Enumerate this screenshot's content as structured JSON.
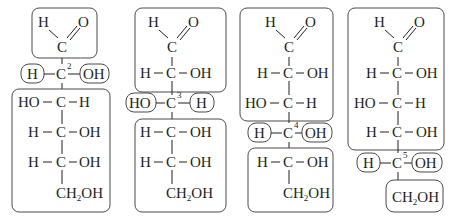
{
  "figure": {
    "panels": [
      {
        "highlighted_carbon": "2",
        "top": {
          "aldehyde_H": "H",
          "aldehyde_O": "O",
          "carbon": "C"
        },
        "chiral_row": {
          "left": "H",
          "center": "C",
          "right": "OH",
          "label": "2"
        },
        "rows_below": [
          {
            "left": "HO",
            "center": "C",
            "right": "H"
          },
          {
            "left": "H",
            "center": "C",
            "right": "OH"
          },
          {
            "left": "H",
            "center": "C",
            "right": "OH"
          }
        ],
        "terminal": {
          "ch": "CH",
          "sub": "2",
          "oh": "OH"
        }
      },
      {
        "highlighted_carbon": "3",
        "top": {
          "aldehyde_H": "H",
          "aldehyde_O": "O",
          "carbon": "C"
        },
        "rows_above": [
          {
            "left": "H",
            "center": "C",
            "right": "OH"
          }
        ],
        "chiral_row": {
          "left": "HO",
          "center": "C",
          "right": "H",
          "label": "3"
        },
        "rows_below": [
          {
            "left": "H",
            "center": "C",
            "right": "OH"
          },
          {
            "left": "H",
            "center": "C",
            "right": "OH"
          }
        ],
        "terminal": {
          "ch": "CH",
          "sub": "2",
          "oh": "OH"
        }
      },
      {
        "highlighted_carbon": "4",
        "top": {
          "aldehyde_H": "H",
          "aldehyde_O": "O",
          "carbon": "C"
        },
        "rows_above": [
          {
            "left": "H",
            "center": "C",
            "right": "OH"
          },
          {
            "left": "HO",
            "center": "C",
            "right": "H"
          }
        ],
        "chiral_row": {
          "left": "H",
          "center": "C",
          "right": "OH",
          "label": "4"
        },
        "rows_below": [
          {
            "left": "H",
            "center": "C",
            "right": "OH"
          }
        ],
        "terminal": {
          "ch": "CH",
          "sub": "2",
          "oh": "OH"
        }
      },
      {
        "highlighted_carbon": "5",
        "top": {
          "aldehyde_H": "H",
          "aldehyde_O": "O",
          "carbon": "C"
        },
        "rows_above": [
          {
            "left": "H",
            "center": "C",
            "right": "OH"
          },
          {
            "left": "HO",
            "center": "C",
            "right": "H"
          },
          {
            "left": "H",
            "center": "C",
            "right": "OH"
          }
        ],
        "chiral_row": {
          "left": "H",
          "center": "C",
          "right": "OH",
          "label": "5"
        },
        "terminal": {
          "ch": "CH",
          "sub": "2",
          "oh": "OH"
        }
      }
    ]
  }
}
